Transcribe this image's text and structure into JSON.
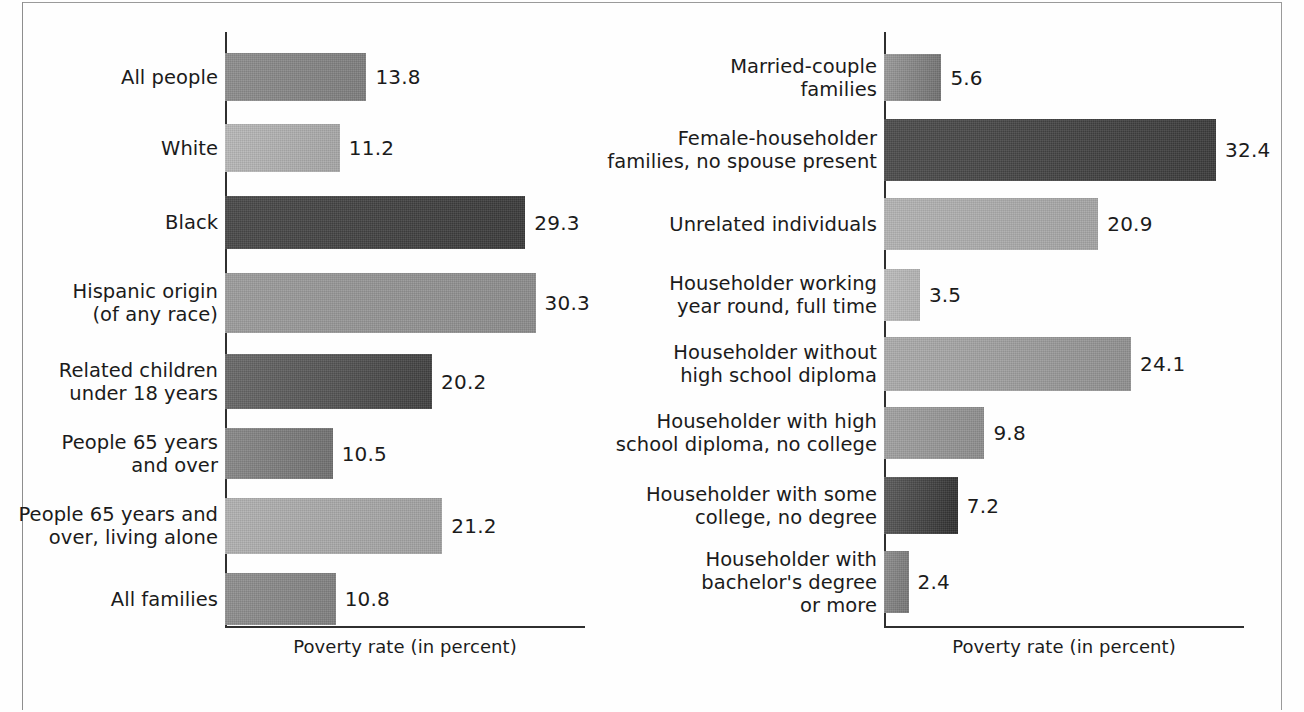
{
  "figure": {
    "axis_title": "Poverty rate (in percent)",
    "frame_color": "#9a9a9a",
    "axis_color": "#2f2f2f",
    "text_color": "#1b1b1b"
  },
  "chart_data": [
    {
      "type": "bar",
      "orientation": "horizontal",
      "panel": "left",
      "title": "",
      "xlabel": "Poverty rate (in percent)",
      "ylabel": "",
      "xlim": [
        0,
        34.5
      ],
      "grid": false,
      "legend": "none",
      "categories": [
        "All people",
        "White",
        "Black",
        "Hispanic origin\n(of any race)",
        "Related children\nunder 18 years",
        "People 65 years\nand over",
        "People 65 years and\nover, living alone",
        "All families"
      ],
      "values": [
        13.8,
        11.2,
        29.3,
        30.3,
        20.2,
        10.5,
        21.2,
        10.8
      ],
      "value_labels": [
        "13.8",
        "11.2",
        "29.3",
        "30.3",
        "20.2",
        "10.5",
        "21.2",
        "10.8"
      ],
      "bar_colors": [
        "#8e8e8e",
        "#b9b9b9",
        "#4a4a4a",
        "#9d9d9d",
        "#6a6a6a",
        "#8a8a8a",
        "#b2b2b2",
        "#909090"
      ],
      "bar_colors_end": [
        "#7d7d7d",
        "#a6a6a6",
        "#3a3a3a",
        "#8b8b8b",
        "#3f3f3f",
        "#6f6f6f",
        "#a0a0a0",
        "#7f7f7f"
      ]
    },
    {
      "type": "bar",
      "orientation": "horizontal",
      "panel": "right",
      "title": "",
      "xlabel": "Poverty rate (in percent)",
      "ylabel": "",
      "xlim": [
        0,
        34.5
      ],
      "grid": false,
      "legend": "none",
      "categories": [
        "Married-couple\nfamilies",
        "Female-householder\nfamilies, no spouse present",
        "Unrelated individuals",
        "Householder working\nyear round, full time",
        "Householder without\nhigh school diploma",
        "Householder with high\nschool diploma, no college",
        "Householder with some\ncollege, no degree",
        "Householder with\nbachelor's degree\nor more"
      ],
      "values": [
        5.6,
        32.4,
        20.9,
        3.5,
        24.1,
        9.8,
        7.2,
        2.4
      ],
      "value_labels": [
        "5.6",
        "32.4",
        "20.9",
        "3.5",
        "24.1",
        "9.8",
        "7.2",
        "2.4"
      ],
      "bar_colors": [
        "#9c9c9c",
        "#4d4d4d",
        "#b4b4b4",
        "#bdbdbd",
        "#adadad",
        "#a3a3a3",
        "#5c5c5c",
        "#8f8f8f"
      ],
      "bar_colors_end": [
        "#6f6f6f",
        "#3b3b3b",
        "#a4a4a4",
        "#b0b0b0",
        "#8f8f8f",
        "#8c8c8c",
        "#2e2e2e",
        "#747474"
      ]
    }
  ]
}
